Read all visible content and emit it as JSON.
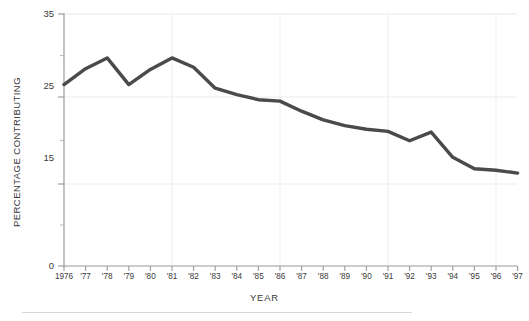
{
  "chart_data": {
    "type": "line",
    "title": "",
    "xlabel": "YEAR",
    "ylabel": "PERCENTAGE CONTRIBUTING",
    "x": [
      1976,
      1977,
      1978,
      1979,
      1980,
      1981,
      1982,
      1983,
      1984,
      1985,
      1986,
      1987,
      1988,
      1989,
      1990,
      1991,
      1992,
      1993,
      1994,
      1995,
      1996,
      1997
    ],
    "categories": [
      "1976",
      "'77",
      "'78",
      "'79",
      "'80",
      "'81",
      "'82",
      "'83",
      "'84",
      "'85",
      "'86",
      "'87",
      "'88",
      "'89",
      "'90",
      "'91",
      "'92",
      "'93",
      "'94",
      "'95",
      "'96",
      "'97"
    ],
    "values": [
      25.2,
      27.4,
      28.9,
      25.2,
      27.3,
      28.9,
      27.6,
      24.7,
      23.8,
      23.1,
      22.9,
      21.5,
      20.3,
      19.5,
      19.0,
      18.7,
      17.4,
      18.6,
      15.1,
      13.5,
      13.3,
      12.9
    ],
    "series": [
      {
        "name": "Percentage contributing",
        "values": [
          25.2,
          27.4,
          28.9,
          25.2,
          27.3,
          28.9,
          27.6,
          24.7,
          23.8,
          23.1,
          22.9,
          21.5,
          20.3,
          19.5,
          19.0,
          18.7,
          17.4,
          18.6,
          15.1,
          13.5,
          13.3,
          12.9
        ],
        "color": "#4a4a4a"
      }
    ],
    "ylim": [
      0,
      35
    ],
    "yticks": [
      0,
      15,
      25,
      35
    ],
    "ytick_labels": [
      "0",
      "15",
      "25",
      "35"
    ],
    "y_minor_ticks": [
      5,
      10,
      20,
      30
    ],
    "xlim": [
      1976,
      1997
    ],
    "grid": {
      "horizontal_at": [
        15,
        25,
        35
      ],
      "vertical_at": [
        1976,
        1981,
        1986,
        1991,
        1996
      ],
      "color": "#e6e6e6"
    },
    "legend": null,
    "legend_position": "none",
    "line_width": 3.4,
    "axis_color": "#8a8a8a"
  }
}
